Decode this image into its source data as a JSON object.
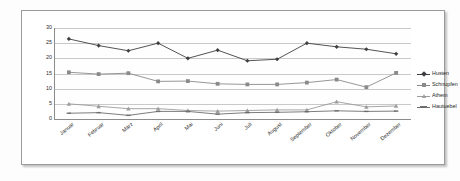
{
  "chart_data": {
    "type": "line",
    "title": "",
    "xlabel": "",
    "ylabel": "",
    "ylim": [
      0,
      30
    ],
    "yticks": [
      0,
      5,
      10,
      15,
      20,
      25,
      30
    ],
    "grid": true,
    "legend_position": "right",
    "categories": [
      "Januar",
      "Februar",
      "März",
      "April",
      "Mai",
      "Juni",
      "Juli",
      "August",
      "September",
      "Oktober",
      "November",
      "Dezember"
    ],
    "series": [
      {
        "name": "Husten",
        "marker": "diamond",
        "color": "#3f3f3f",
        "values": [
          26.4,
          24.2,
          22.5,
          25.0,
          20.0,
          22.7,
          19.2,
          19.7,
          25.0,
          23.8,
          23.0,
          21.5
        ]
      },
      {
        "name": "Schnupfen",
        "marker": "square",
        "color": "#8a8a8a",
        "values": [
          15.4,
          14.8,
          15.1,
          12.4,
          12.5,
          11.6,
          11.4,
          11.4,
          12.0,
          13.0,
          10.5,
          15.2
        ]
      },
      {
        "name": "Athem",
        "marker": "triangle",
        "color": "#9c9c9c",
        "values": [
          5.0,
          4.2,
          3.4,
          3.4,
          2.8,
          2.6,
          2.8,
          3.0,
          3.0,
          5.7,
          4.0,
          4.3
        ]
      },
      {
        "name": "Hautuebel",
        "marker": "dash",
        "color": "#6e6e6e",
        "values": [
          1.9,
          2.1,
          1.2,
          2.5,
          2.5,
          1.6,
          2.1,
          2.2,
          2.4,
          2.7,
          2.5,
          2.6
        ]
      }
    ]
  },
  "legend": {
    "items": [
      {
        "label": "Husten"
      },
      {
        "label": "Schnupfen"
      },
      {
        "label": "Athem"
      },
      {
        "label": "Hautuebel"
      }
    ]
  }
}
